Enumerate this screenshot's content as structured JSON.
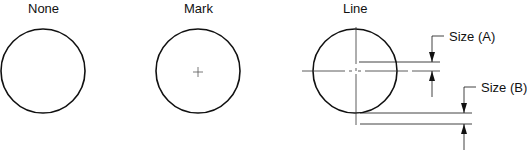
{
  "diagram": {
    "panels": [
      {
        "id": "none",
        "label": "None"
      },
      {
        "id": "mark",
        "label": "Mark"
      },
      {
        "id": "line",
        "label": "Line"
      }
    ],
    "dimensions": [
      {
        "id": "size-a",
        "label": "Size (A)"
      },
      {
        "id": "size-b",
        "label": "Size (B)"
      }
    ],
    "colors": {
      "stroke": "#111111",
      "background": "#ffffff"
    }
  }
}
